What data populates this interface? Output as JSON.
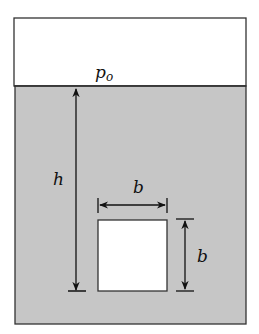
{
  "diagram": {
    "labels": {
      "surface_pressure": "p",
      "surface_pressure_sub": "o",
      "depth": "h",
      "width": "b",
      "height": "b"
    },
    "colors": {
      "fluid": "#c6c6c6",
      "air": "#ffffff",
      "outline": "#333333",
      "gate": "#ffffff"
    }
  }
}
